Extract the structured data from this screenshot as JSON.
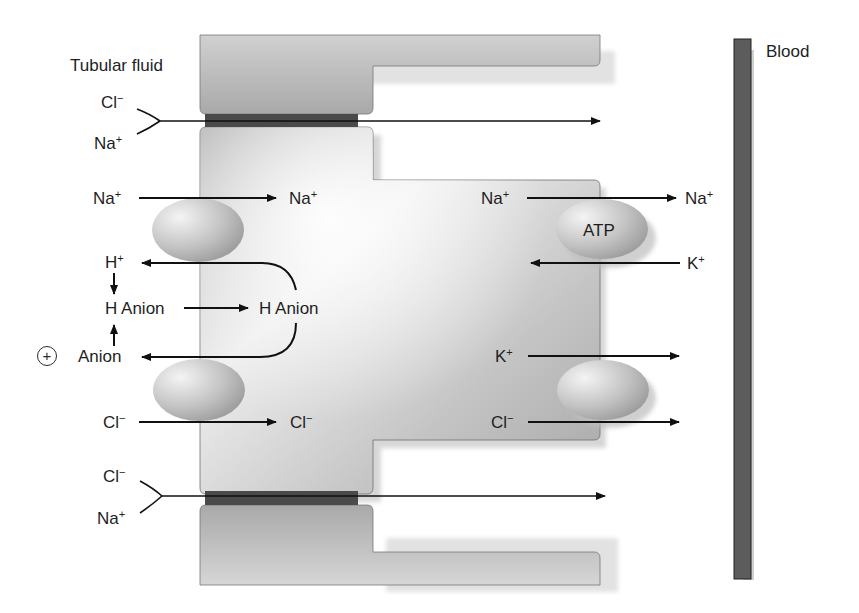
{
  "diagram": {
    "type": "renal tubule epithelial cell ion transport",
    "regions": {
      "lumen_label": "Tubular fluid",
      "blood_label": "Blood"
    },
    "colors": {
      "cell_fill": "#b8b8b8",
      "cell_highlight": "#ececec",
      "tight_junction": "#4a4a4a",
      "blood_vessel": "#5c5c5c",
      "arrow": "#111111",
      "text": "#1e1e1e"
    },
    "paracellular_top": {
      "ion1": {
        "sym": "Cl",
        "charge": "−"
      },
      "ion2": {
        "sym": "Na",
        "charge": "+"
      }
    },
    "paracellular_bottom": {
      "ion1": {
        "sym": "Cl",
        "charge": "−"
      },
      "ion2": {
        "sym": "Na",
        "charge": "+"
      }
    },
    "apical": {
      "na_in": {
        "from": {
          "sym": "Na",
          "charge": "+"
        },
        "to": {
          "sym": "Na",
          "charge": "+"
        }
      },
      "h_out": {
        "sym": "H",
        "charge": "+"
      },
      "h_anion_lumen": "H Anion",
      "h_anion_cell": "H Anion",
      "anion_out": "Anion",
      "anion_sign": "+",
      "cl_in": {
        "from": {
          "sym": "Cl",
          "charge": "−"
        },
        "to": {
          "sym": "Cl",
          "charge": "−"
        }
      }
    },
    "basolateral": {
      "pump_label": "ATP",
      "na_out": {
        "from": {
          "sym": "Na",
          "charge": "+"
        },
        "to": {
          "sym": "Na",
          "charge": "+"
        }
      },
      "k_in": {
        "sym": "K",
        "charge": "+"
      },
      "k_out": {
        "sym": "K",
        "charge": "+"
      },
      "cl_out": {
        "sym": "Cl",
        "charge": "−"
      }
    }
  }
}
